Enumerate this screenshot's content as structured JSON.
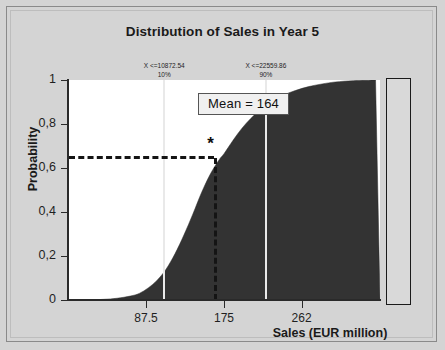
{
  "chart_data": {
    "type": "area",
    "title": "Distribution of Sales in Year 5",
    "xlabel": "Sales (EUR million)",
    "ylabel": "Probability",
    "xlim": [
      0,
      350
    ],
    "ylim": [
      0,
      1
    ],
    "grid": false,
    "legend": "none",
    "x_ticks": [
      {
        "value": 87.5,
        "label": "87.5"
      },
      {
        "value": 175,
        "label": "175"
      },
      {
        "value": 262,
        "label": "262"
      }
    ],
    "y_ticks": [
      {
        "value": 0,
        "label": "0"
      },
      {
        "value": 0.2,
        "label": "0,2"
      },
      {
        "value": 0.4,
        "label": "0,4"
      },
      {
        "value": 0.6,
        "label": "0,6"
      },
      {
        "value": 0.8,
        "label": "0,8"
      },
      {
        "value": 1,
        "label": "1"
      }
    ],
    "series": [
      {
        "name": "Cumulative distribution of sales",
        "type": "area",
        "fill_color": "#333333",
        "x": [
          0,
          20,
          40,
          55,
          70,
          80,
          90,
          100,
          110,
          120,
          130,
          140,
          150,
          160,
          170,
          175,
          185,
          195,
          205,
          215,
          225,
          240,
          255,
          270,
          285,
          300,
          320,
          345
        ],
        "y": [
          0.0,
          0.0,
          0.003,
          0.008,
          0.018,
          0.03,
          0.055,
          0.09,
          0.14,
          0.21,
          0.295,
          0.39,
          0.49,
          0.575,
          0.64,
          0.665,
          0.725,
          0.78,
          0.825,
          0.862,
          0.893,
          0.928,
          0.952,
          0.97,
          0.982,
          0.991,
          0.997,
          1.0
        ]
      }
    ],
    "annotations": [
      {
        "name": "p10-marker",
        "x": 108,
        "value_label": "X <=10872.54",
        "percent_label": "10%",
        "line_color": "#e9e9e9"
      },
      {
        "name": "p90-marker",
        "x": 222,
        "value_label": "X <=22559.86",
        "percent_label": "90%",
        "line_color": "#e9e9e9"
      },
      {
        "name": "mean-marker",
        "x": 164,
        "y": 0.655,
        "box_label": "Mean = 164",
        "star_glyph": "*",
        "line_style": "dashed",
        "line_color": "#141414"
      }
    ]
  },
  "colors": {
    "background": "#d4d4d4",
    "plot_background": "#ffffff",
    "area_fill": "#333333",
    "axis": "#2a2a2a",
    "text": "#1a1a1a",
    "percentile_line": "#e9e9e9",
    "mean_line": "#141414"
  }
}
